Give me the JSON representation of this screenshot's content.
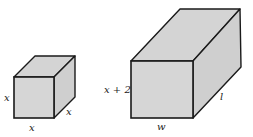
{
  "figure": {
    "colors": {
      "face": "#d4d4d4",
      "edge": "#1a1a1a",
      "background": "#ffffff"
    }
  },
  "cube": {
    "labels": {
      "height": "x",
      "width": "x",
      "depth": "x"
    }
  },
  "box": {
    "labels": {
      "height": "x + 2",
      "width": "w",
      "length": "l"
    }
  }
}
